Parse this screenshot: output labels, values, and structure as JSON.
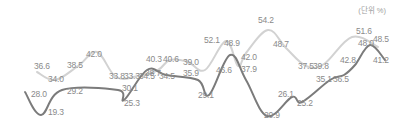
{
  "unit_label": "(단위 %)",
  "colors": {
    "series_light": "#cfcfcf",
    "series_dark": "#7d7d7d",
    "label": "#8a8a8a"
  },
  "chart_data": {
    "type": "line",
    "title": "",
    "unit": "(단위 %)",
    "xlabel": "",
    "ylabel": "",
    "grid": false,
    "series": [
      {
        "name": "series_light",
        "color": "#cfcfcf",
        "values": [
          36.6,
          34.0,
          38.5,
          42.0,
          33.8,
          33.3,
          34.5,
          40.3,
          40.6,
          39.0,
          52.1,
          46.6,
          42.0,
          54.2,
          48.7,
          37.5,
          39.8,
          51.6,
          48.5
        ],
        "points": [
          [
            37,
            72
          ],
          [
            55,
            80
          ],
          [
            78,
            66
          ],
          [
            97,
            52
          ],
          [
            116,
            77
          ],
          [
            138,
            76
          ],
          [
            158,
            70
          ],
          [
            170,
            60
          ],
          [
            188,
            62
          ],
          [
            205,
            70
          ],
          [
            226,
            41
          ],
          [
            238,
            66
          ],
          [
            246,
            53
          ],
          [
            268,
            30
          ],
          [
            286,
            48
          ],
          [
            306,
            66
          ],
          [
            324,
            64
          ],
          [
            352,
            37
          ],
          [
            378,
            47
          ]
        ]
      },
      {
        "name": "series_dark",
        "color": "#7d7d7d",
        "values": [
          28.0,
          19.3,
          29.2,
          30.1,
          25.3,
          38.7,
          34.5,
          35.9,
          29.1,
          48.9,
          37.9,
          20.9,
          26.1,
          25.2,
          35.1,
          36.5,
          42.8,
          48.0,
          41.2
        ],
        "points": [
          [
            25,
            92
          ],
          [
            41,
            115
          ],
          [
            62,
            90
          ],
          [
            118,
            90
          ],
          [
            124,
            100
          ],
          [
            147,
            70
          ],
          [
            166,
            75
          ],
          [
            198,
            80
          ],
          [
            209,
            95
          ],
          [
            230,
            55
          ],
          [
            246,
            80
          ],
          [
            267,
            116
          ],
          [
            292,
            97
          ],
          [
            302,
            102
          ],
          [
            330,
            80
          ],
          [
            344,
            75
          ],
          [
            355,
            65
          ],
          [
            370,
            45
          ],
          [
            385,
            60
          ]
        ]
      }
    ]
  },
  "labels_light": [
    {
      "text": "36.6",
      "x": 34,
      "y": 68
    },
    {
      "text": "34.0",
      "x": 48,
      "y": 81
    },
    {
      "text": "38.5",
      "x": 67,
      "y": 67
    },
    {
      "text": "42.0",
      "x": 86,
      "y": 56
    },
    {
      "text": "33.8",
      "x": 109,
      "y": 78
    },
    {
      "text": "33.3",
      "x": 124,
      "y": 78
    },
    {
      "text": "34.5",
      "x": 139,
      "y": 78
    },
    {
      "text": "40.3",
      "x": 146,
      "y": 61
    },
    {
      "text": "40.6",
      "x": 163,
      "y": 61
    },
    {
      "text": "39.0",
      "x": 183,
      "y": 64
    },
    {
      "text": "52.1",
      "x": 204,
      "y": 42
    },
    {
      "text": "46.6",
      "x": 216,
      "y": 72
    },
    {
      "text": "42.0",
      "x": 241,
      "y": 59
    },
    {
      "text": "54.2",
      "x": 258,
      "y": 22
    },
    {
      "text": "48.7",
      "x": 273,
      "y": 46
    },
    {
      "text": "37.5",
      "x": 298,
      "y": 68
    },
    {
      "text": "39.8",
      "x": 313,
      "y": 68
    },
    {
      "text": "51.6",
      "x": 356,
      "y": 33
    },
    {
      "text": "48.5",
      "x": 373,
      "y": 41
    }
  ],
  "labels_dark": [
    {
      "text": "28.0",
      "x": 31,
      "y": 96
    },
    {
      "text": "19.3",
      "x": 48,
      "y": 114
    },
    {
      "text": "29.2",
      "x": 67,
      "y": 93
    },
    {
      "text": "30.1",
      "x": 122,
      "y": 90
    },
    {
      "text": "25.3",
      "x": 124,
      "y": 105
    },
    {
      "text": "38.7",
      "x": 145,
      "y": 75
    },
    {
      "text": "34.5",
      "x": 159,
      "y": 78
    },
    {
      "text": "35.9",
      "x": 183,
      "y": 75
    },
    {
      "text": "29.1",
      "x": 198,
      "y": 97
    },
    {
      "text": "48.9",
      "x": 224,
      "y": 45
    },
    {
      "text": "37.9",
      "x": 241,
      "y": 71
    },
    {
      "text": "20.9",
      "x": 264,
      "y": 117
    },
    {
      "text": "26.1",
      "x": 278,
      "y": 96
    },
    {
      "text": "25.2",
      "x": 297,
      "y": 105
    },
    {
      "text": "35.1",
      "x": 316,
      "y": 81
    },
    {
      "text": "36.5",
      "x": 333,
      "y": 81
    },
    {
      "text": "42.8",
      "x": 340,
      "y": 62
    },
    {
      "text": "48.0",
      "x": 358,
      "y": 45
    },
    {
      "text": "41.2",
      "x": 373,
      "y": 62
    }
  ]
}
